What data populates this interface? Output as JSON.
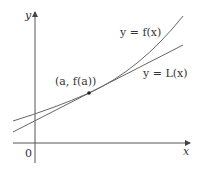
{
  "diagram": {
    "axes": {
      "x_label": "x",
      "y_label": "y",
      "origin_label": "0"
    },
    "curves": [
      {
        "name": "f",
        "label": "y = f(x)",
        "type": "convex curve"
      },
      {
        "name": "L",
        "label": "y = L(x)",
        "type": "tangent line"
      }
    ],
    "point": {
      "label": "(a, f(a))"
    },
    "colors": {
      "stroke": "#555555",
      "background": "#ffffff"
    }
  }
}
